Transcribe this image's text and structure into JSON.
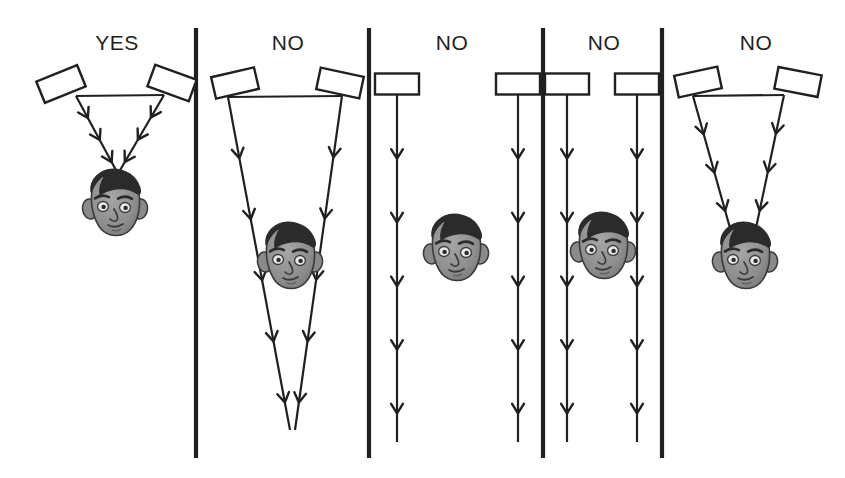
{
  "figure": {
    "type": "instructional-diagram",
    "width": 845,
    "height": 478,
    "background_color": "#ffffff",
    "ink_color": "#231f20",
    "face_skin_color": "#8c8c8c",
    "face_hair_color": "#2b2b2b",
    "divider_color": "#231f20"
  },
  "dividers": [
    {
      "name": "divider-1",
      "x": 196,
      "y_top": 28,
      "y_bottom": 458
    },
    {
      "name": "divider-2",
      "x": 369,
      "y_top": 28,
      "y_bottom": 458
    },
    {
      "name": "divider-3",
      "x": 543,
      "y_top": 28,
      "y_bottom": 458
    },
    {
      "name": "divider-4",
      "x": 662,
      "y_top": 28,
      "y_bottom": 458
    }
  ],
  "panels": [
    {
      "id": "panel-1",
      "label": "YES",
      "label_x": 117,
      "label_y": 50,
      "verdict": "yes",
      "description": "Angled speakers converge on the listener's head; correct toe-in",
      "speakers": [
        {
          "name": "speaker-left",
          "cx": 61,
          "cy": 84,
          "w": 44,
          "h": 23,
          "rotation": -22
        },
        {
          "name": "speaker-right",
          "cx": 172,
          "cy": 83,
          "w": 44,
          "h": 23,
          "rotation": 20
        }
      ],
      "baseline": {
        "x1": 76,
        "y1": 96,
        "x2": 164,
        "y2": 95
      },
      "beams": [
        {
          "name": "beam-left",
          "x1": 76,
          "y1": 96,
          "x2": 117,
          "y2": 172,
          "chevrons": 3
        },
        {
          "name": "beam-right",
          "x1": 164,
          "y1": 95,
          "x2": 119,
          "y2": 172,
          "chevrons": 3
        }
      ],
      "head": {
        "name": "listener-head",
        "cx": 115,
        "cy": 205,
        "scale": 1.0
      },
      "converges_on_head": true
    },
    {
      "id": "panel-2",
      "label": "NO",
      "label_x": 288,
      "label_y": 50,
      "verdict": "no",
      "description": "Speakers toed in too far; beams cross well behind the listener",
      "speakers": [
        {
          "name": "speaker-left",
          "cx": 235,
          "cy": 83,
          "w": 44,
          "h": 22,
          "rotation": -13
        },
        {
          "name": "speaker-right",
          "cx": 340,
          "cy": 83,
          "w": 44,
          "h": 22,
          "rotation": 12
        }
      ],
      "baseline": {
        "x1": 228,
        "y1": 97,
        "x2": 342,
        "y2": 96
      },
      "beams": [
        {
          "name": "beam-left",
          "x1": 228,
          "y1": 97,
          "x2": 290,
          "y2": 430,
          "chevrons": 5
        },
        {
          "name": "beam-right",
          "x1": 342,
          "y1": 96,
          "x2": 295,
          "y2": 430,
          "chevrons": 5
        }
      ],
      "head": {
        "name": "listener-head",
        "cx": 290,
        "cy": 258,
        "scale": 1.0
      },
      "converges_on_head": false
    },
    {
      "id": "panel-3",
      "label": "NO",
      "label_x": 452,
      "label_y": 50,
      "verdict": "no",
      "description": "Speakers fire straight ahead and listener sits off to the side",
      "speakers": [
        {
          "name": "speaker-left",
          "cx": 397,
          "cy": 84,
          "w": 44,
          "h": 21,
          "rotation": 0
        },
        {
          "name": "speaker-right",
          "cx": 518,
          "cy": 84,
          "w": 44,
          "h": 21,
          "rotation": 0
        }
      ],
      "baseline": null,
      "beams": [
        {
          "name": "beam-left",
          "x1": 397,
          "y1": 95,
          "x2": 397,
          "y2": 442,
          "chevrons": 5
        },
        {
          "name": "beam-right",
          "x1": 518,
          "y1": 95,
          "x2": 518,
          "y2": 442,
          "chevrons": 5
        }
      ],
      "head": {
        "name": "listener-head",
        "cx": 456,
        "cy": 250,
        "scale": 1.0
      },
      "converges_on_head": false
    },
    {
      "id": "panel-4",
      "label": "NO",
      "label_x": 604,
      "label_y": 50,
      "verdict": "no",
      "description": "Parallel straight-ahead beams straddle the listener without converging",
      "speakers": [
        {
          "name": "speaker-left",
          "cx": 567,
          "cy": 84,
          "w": 44,
          "h": 21,
          "rotation": 0
        },
        {
          "name": "speaker-right",
          "cx": 637,
          "cy": 84,
          "w": 44,
          "h": 21,
          "rotation": 0
        }
      ],
      "baseline": null,
      "beams": [
        {
          "name": "beam-left",
          "x1": 567,
          "y1": 95,
          "x2": 567,
          "y2": 442,
          "chevrons": 5
        },
        {
          "name": "beam-right",
          "x1": 637,
          "y1": 95,
          "x2": 637,
          "y2": 442,
          "chevrons": 5
        }
      ],
      "head": {
        "name": "listener-head",
        "cx": 603,
        "cy": 248,
        "scale": 1.0
      },
      "converges_on_head": false
    },
    {
      "id": "panel-5",
      "label": "NO",
      "label_x": 756,
      "label_y": 50,
      "verdict": "no",
      "description": "Listener sits too close; beams converge at the head but speakers are too near",
      "speakers": [
        {
          "name": "speaker-left",
          "cx": 698,
          "cy": 82,
          "w": 44,
          "h": 22,
          "rotation": -12
        },
        {
          "name": "speaker-right",
          "cx": 798,
          "cy": 82,
          "w": 44,
          "h": 22,
          "rotation": 11
        }
      ],
      "baseline": {
        "x1": 693,
        "y1": 96,
        "x2": 784,
        "y2": 95
      },
      "beams": [
        {
          "name": "beam-left",
          "x1": 693,
          "y1": 96,
          "x2": 730,
          "y2": 228,
          "chevrons": 3
        },
        {
          "name": "beam-right",
          "x1": 784,
          "y1": 95,
          "x2": 756,
          "y2": 228,
          "chevrons": 3
        }
      ],
      "head": {
        "name": "listener-head",
        "cx": 745,
        "cy": 258,
        "scale": 1.0
      },
      "converges_on_head": true
    }
  ]
}
